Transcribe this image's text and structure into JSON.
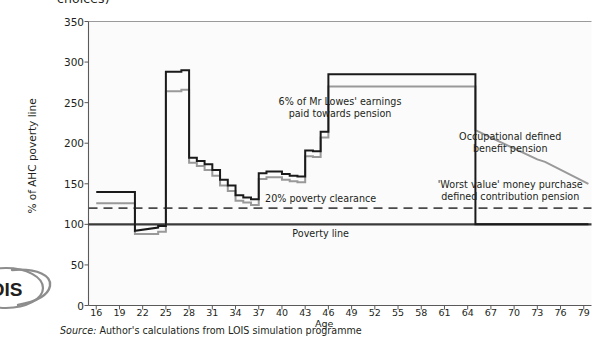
{
  "figure": {
    "top_caption_fragment": "choices)",
    "logo_text": "OIS",
    "source_prefix": "Source:",
    "source_text": "Author's calculations from LOIS simulation programme"
  },
  "chart_data": {
    "type": "line",
    "title": "",
    "xlabel": "Age",
    "ylabel": "% of AHC poverty line",
    "xlim": [
      15,
      80
    ],
    "ylim": [
      0,
      350
    ],
    "grid": false,
    "legend_position": "inline-annotations",
    "x_ticks": [
      16,
      19,
      22,
      25,
      28,
      31,
      34,
      37,
      40,
      43,
      46,
      49,
      52,
      55,
      58,
      61,
      64,
      67,
      70,
      73,
      76,
      79
    ],
    "y_ticks": [
      0,
      50,
      100,
      150,
      200,
      250,
      300,
      350
    ],
    "annotations": [
      {
        "id": "contribution-note",
        "lines": [
          "6% of Mr Lowes' earnings",
          "paid towards pension"
        ],
        "x": 47.5,
        "y": 243
      },
      {
        "id": "occupational-note",
        "lines": [
          "Occupational defined",
          "benefit pension"
        ],
        "x": 69.5,
        "y": 200
      },
      {
        "id": "money-purchase-note",
        "lines": [
          "'Worst value' money purchase",
          "defined contribution pension"
        ],
        "x": 69.5,
        "y": 141
      },
      {
        "id": "poverty-clearance-note",
        "lines": [
          "20% poverty clearance"
        ],
        "x": 45.0,
        "y": 131
      },
      {
        "id": "poverty-line-note",
        "lines": [
          "Poverty line"
        ],
        "x": 45.0,
        "y": 88
      }
    ],
    "reference_lines": [
      {
        "id": "poverty-line",
        "value": 100,
        "style": "solid",
        "color": "#3a3a3a"
      },
      {
        "id": "poverty-clearance-line",
        "value": 120,
        "style": "dashed",
        "color": "#4a4a4a"
      }
    ],
    "series": [
      {
        "name": "Occupational defined benefit pension",
        "color": "#999999",
        "step": true,
        "points": [
          [
            16,
            126
          ],
          [
            21,
            126
          ],
          [
            21,
            88
          ],
          [
            24,
            88
          ],
          [
            24,
            91
          ],
          [
            25,
            91
          ],
          [
            25,
            264
          ],
          [
            27,
            264
          ],
          [
            27,
            266
          ],
          [
            28,
            266
          ],
          [
            28,
            176
          ],
          [
            29,
            176
          ],
          [
            29,
            172
          ],
          [
            30,
            172
          ],
          [
            30,
            167
          ],
          [
            31,
            167
          ],
          [
            31,
            160
          ],
          [
            32,
            160
          ],
          [
            32,
            148
          ],
          [
            33,
            148
          ],
          [
            33,
            141
          ],
          [
            34,
            141
          ],
          [
            34,
            129
          ],
          [
            35,
            129
          ],
          [
            35,
            127
          ],
          [
            36,
            127
          ],
          [
            36,
            124
          ],
          [
            37,
            124
          ],
          [
            37,
            156
          ],
          [
            38,
            156
          ],
          [
            38,
            158
          ],
          [
            40,
            158
          ],
          [
            40,
            155
          ],
          [
            41,
            155
          ],
          [
            41,
            153
          ],
          [
            42,
            153
          ],
          [
            42,
            152
          ],
          [
            43,
            152
          ],
          [
            43,
            184
          ],
          [
            44,
            184
          ],
          [
            44,
            183
          ],
          [
            45,
            183
          ],
          [
            45,
            207
          ],
          [
            46,
            207
          ],
          [
            46,
            270
          ],
          [
            65,
            270
          ],
          [
            65,
            216
          ],
          [
            73,
            180
          ],
          [
            74,
            177
          ],
          [
            79.6,
            150
          ]
        ]
      },
      {
        "name": "'Worst value' money purchase defined contribution pension",
        "color": "#1a1a1a",
        "step": true,
        "points": [
          [
            16,
            140
          ],
          [
            21,
            140
          ],
          [
            21,
            92
          ],
          [
            24,
            96
          ],
          [
            24,
            98
          ],
          [
            25,
            98
          ],
          [
            25,
            288
          ],
          [
            27,
            288
          ],
          [
            27,
            290
          ],
          [
            28,
            290
          ],
          [
            28,
            182
          ],
          [
            29,
            182
          ],
          [
            29,
            178
          ],
          [
            30,
            178
          ],
          [
            30,
            174
          ],
          [
            31,
            174
          ],
          [
            31,
            167
          ],
          [
            32,
            167
          ],
          [
            32,
            155
          ],
          [
            33,
            155
          ],
          [
            33,
            148
          ],
          [
            34,
            148
          ],
          [
            34,
            136
          ],
          [
            35,
            136
          ],
          [
            35,
            133
          ],
          [
            36,
            133
          ],
          [
            36,
            131
          ],
          [
            37,
            131
          ],
          [
            37,
            163
          ],
          [
            38,
            163
          ],
          [
            38,
            165
          ],
          [
            40,
            165
          ],
          [
            40,
            162
          ],
          [
            41,
            162
          ],
          [
            41,
            160
          ],
          [
            42,
            160
          ],
          [
            42,
            159
          ],
          [
            43,
            159
          ],
          [
            43,
            191
          ],
          [
            44,
            191
          ],
          [
            44,
            190
          ],
          [
            45,
            190
          ],
          [
            45,
            214
          ],
          [
            46,
            214
          ],
          [
            46,
            285
          ],
          [
            65,
            285
          ],
          [
            65,
            100
          ],
          [
            79.6,
            100
          ]
        ]
      }
    ]
  }
}
